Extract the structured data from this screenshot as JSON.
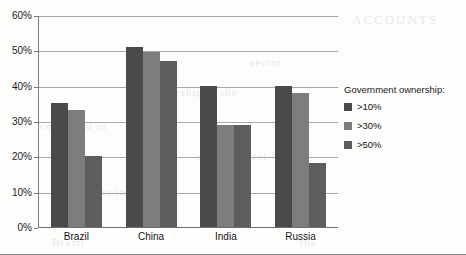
{
  "chart_data": {
    "type": "bar",
    "title": "",
    "subtitle": "",
    "xlabel": "",
    "ylabel": "",
    "categories": [
      "Brazil",
      "China",
      "India",
      "Russia"
    ],
    "series": [
      {
        "name": ">10%",
        "color": "#4a4a4a",
        "values": [
          35,
          51,
          40,
          40
        ]
      },
      {
        "name": ">30%",
        "color": "#7d7d7d",
        "values": [
          33,
          49.5,
          29,
          38
        ]
      },
      {
        "name": ">50%",
        "color": "#5e5e5e",
        "values": [
          20,
          47,
          29,
          18
        ]
      }
    ],
    "ylim": [
      0,
      60
    ],
    "ytick_labels": [
      "0%",
      "10%",
      "20%",
      "30%",
      "40%",
      "50%",
      "60%"
    ],
    "ytick_values": [
      0,
      10,
      20,
      30,
      40,
      50,
      60
    ],
    "grid": "horizontal",
    "legend_position": "right",
    "legend_title": "Government ownership:"
  },
  "scan_artifacts": {
    "a": "ACCOUNTS",
    "b": "ownership in the",
    "c": "continued to",
    "d": "of the largest",
    "e": "remains in",
    "f": "Brazil",
    "g": "the",
    "h": "sector",
    "i": "and"
  }
}
